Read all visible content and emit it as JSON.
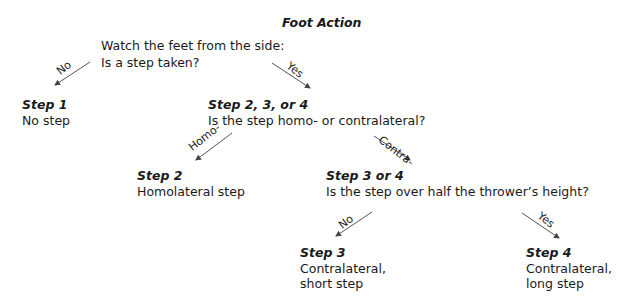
{
  "title": "Foot Action",
  "root": {
    "line1": "Watch the feet from the side:",
    "line2": "Is a step taken?"
  },
  "edges": {
    "root_no": "No",
    "root_yes": "Yes",
    "q2_homo": "Homo-",
    "q2_contra": "Contra-",
    "q3_no": "No",
    "q3_yes": "Yes"
  },
  "step1": {
    "heading": "Step 1",
    "text": "No step"
  },
  "step234": {
    "heading": "Step 2, 3, or 4",
    "text": "Is the step homo- or contralateral?"
  },
  "step2": {
    "heading": "Step 2",
    "text": "Homolateral step"
  },
  "step34": {
    "heading": "Step 3 or 4",
    "text": "Is the step over half the thrower’s height?"
  },
  "step3": {
    "heading": "Step 3",
    "line1": "Contralateral,",
    "line2": "short step"
  },
  "step4": {
    "heading": "Step 4",
    "line1": "Contralateral,",
    "line2": "long step"
  }
}
